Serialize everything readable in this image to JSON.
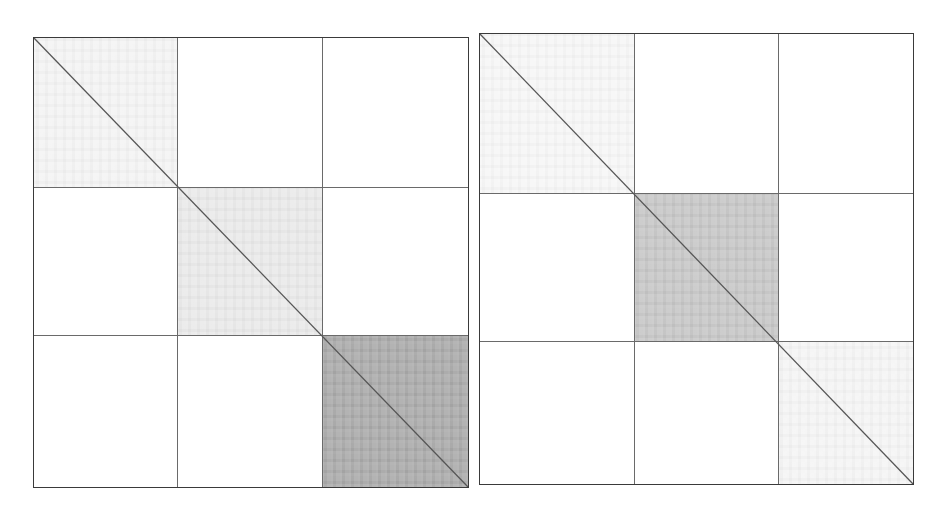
{
  "chart_data": [
    {
      "type": "heatmap",
      "title": "",
      "xlabel": "",
      "ylabel": "",
      "description": "Block-structured similarity matrix, 3x3 block partition, diagonal reference line",
      "grid": true,
      "blocks": 3,
      "block_boundaries_fraction": [
        0.33,
        0.66
      ],
      "block_intensity": [
        [
          0.12,
          0.0,
          0.0
        ],
        [
          0.0,
          0.18,
          0.0
        ],
        [
          0.0,
          0.0,
          0.55
        ]
      ],
      "colors": {
        "low": "#ffffff",
        "high": "#8c8c8c",
        "lines": "#6a6a6a",
        "border": "#3a3a3a",
        "diagonal": "#555555"
      }
    },
    {
      "type": "heatmap",
      "title": "",
      "xlabel": "",
      "ylabel": "",
      "description": "Block-structured similarity matrix, 3x3 block partition, diagonal reference line",
      "grid": true,
      "blocks": 3,
      "block_boundaries_fraction": [
        0.35,
        0.68
      ],
      "block_intensity": [
        [
          0.06,
          0.0,
          0.0
        ],
        [
          0.0,
          0.35,
          0.0
        ],
        [
          0.0,
          0.0,
          0.05
        ]
      ],
      "colors": {
        "low": "#ffffff",
        "high": "#8c8c8c",
        "lines": "#6a6a6a",
        "border": "#3a3a3a",
        "diagonal": "#555555"
      }
    }
  ],
  "panels": [
    {
      "name": "left-matrix",
      "box": {
        "x": 33,
        "y": 37,
        "w": 436,
        "h": 451
      },
      "v_lines": [
        143,
        288
      ],
      "h_lines": [
        149,
        297
      ],
      "shaded_blocks": [
        {
          "x": 0,
          "y": 0,
          "w": 143,
          "h": 149,
          "color": "#f3f3f3"
        },
        {
          "x": 143,
          "y": 149,
          "w": 145,
          "h": 148,
          "color": "#e9e9e9"
        },
        {
          "x": 288,
          "y": 297,
          "w": 146,
          "h": 152,
          "color": "#a9a9a9"
        }
      ]
    },
    {
      "name": "right-matrix",
      "box": {
        "x": 479,
        "y": 33,
        "w": 435,
        "h": 452
      },
      "v_lines": [
        154,
        298
      ],
      "h_lines": [
        159,
        307
      ],
      "shaded_blocks": [
        {
          "x": 0,
          "y": 0,
          "w": 154,
          "h": 159,
          "color": "#f6f6f6"
        },
        {
          "x": 154,
          "y": 159,
          "w": 144,
          "h": 148,
          "color": "#c6c6c6"
        },
        {
          "x": 298,
          "y": 307,
          "w": 135,
          "h": 143,
          "color": "#f4f4f4"
        }
      ]
    }
  ]
}
